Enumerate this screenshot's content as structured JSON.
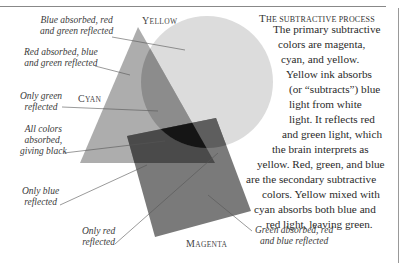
{
  "figure": {
    "shapes": [
      {
        "name": "Yellow",
        "kind": "circle",
        "fill": "#d9d9d9"
      },
      {
        "name": "Cyan",
        "kind": "triangle",
        "fill": "#a7a7a7"
      },
      {
        "name": "Magenta",
        "kind": "square",
        "fill": "#6e6e6e"
      }
    ],
    "shape_labels": {
      "yellow": "Yellow",
      "cyan": "Cyan",
      "magenta": "Magenta"
    },
    "callouts": [
      {
        "line1": "Blue absorbed, red",
        "line2": "and green reflected"
      },
      {
        "line1": "Red absorbed, blue",
        "line2": "and green reflected"
      },
      {
        "line1": "Only green",
        "line2": "reflected"
      },
      {
        "line1": "All colors",
        "line2": "absorbed,",
        "line3": "giving black"
      },
      {
        "line1": "Only blue",
        "line2": "reflected"
      },
      {
        "line1": "Only red",
        "line2": "reflected"
      },
      {
        "line1": "Green absorbed, red",
        "line2": "and blue reflected"
      }
    ]
  },
  "article": {
    "title": "The subtractive process",
    "lines": [
      "The primary subtractive",
      "colors are magenta,",
      "cyan, and yellow.",
      "Yellow ink absorbs",
      "(or “subtracts”) blue",
      "light from white",
      "light. It reflects red",
      "and green light, which",
      "the brain interprets as",
      "yellow. Red, green, and blue",
      "are the secondary subtractive",
      "colors. Yellow mixed with",
      "cyan absorbs both blue and",
      "red light, leaving green."
    ]
  }
}
